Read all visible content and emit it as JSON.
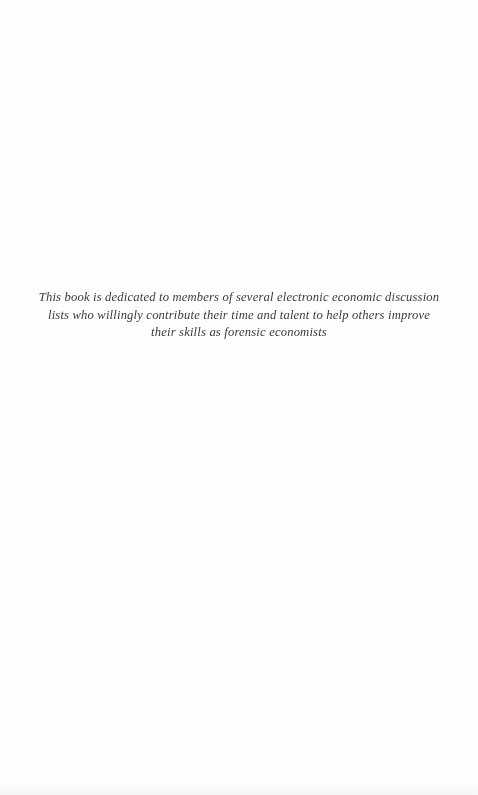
{
  "page": {
    "kind": "book-dedication-page",
    "background_color": "#fefefe",
    "text_color": "#2b2b30"
  },
  "dedication": {
    "full_text": "This book is dedicated to members of several electronic economic discussion lists who willingly contribute their time and talent to help others improve their skills as forensic economists",
    "lines": [
      "This book is dedicated to members of several electronic economic discussion",
      "lists who willingly contribute their time and talent to help others improve",
      "their skills as forensic economists"
    ]
  }
}
